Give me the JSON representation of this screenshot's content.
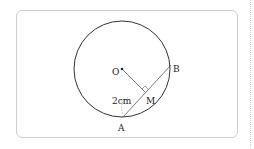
{
  "diagram": {
    "points": {
      "O": {
        "label": "O",
        "x": 122,
        "y": 69
      },
      "A": {
        "label": "A",
        "x": 123,
        "y": 117
      },
      "B": {
        "label": "B",
        "x": 171,
        "y": 65
      },
      "M": {
        "label": "M",
        "x": 145,
        "y": 96
      }
    },
    "circle": {
      "cx": 122,
      "cy": 69,
      "r": 48
    },
    "measure_label": "2cm",
    "colors": {
      "stroke": "#333333",
      "card_border": "#cfcfcf"
    }
  }
}
